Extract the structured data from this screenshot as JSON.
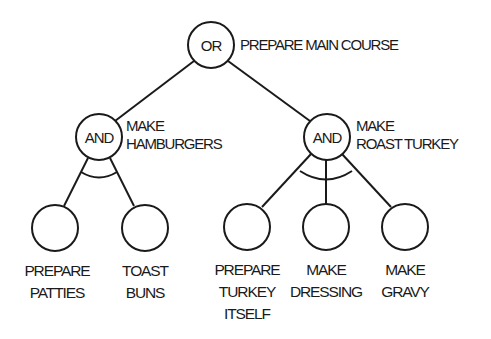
{
  "diagram": {
    "type": "and-or-tree",
    "root": {
      "gate": "OR",
      "label": "PREPARE MAIN COURSE",
      "children": [
        {
          "gate": "AND",
          "label_lines": [
            "MAKE",
            "HAMBURGERS"
          ],
          "children": [
            {
              "label_lines": [
                "PREPARE",
                "PATTIES"
              ]
            },
            {
              "label_lines": [
                "TOAST",
                "BUNS"
              ]
            }
          ]
        },
        {
          "gate": "AND",
          "label_lines": [
            "MAKE",
            "ROAST TURKEY"
          ],
          "children": [
            {
              "label_lines": [
                "PREPARE",
                "TURKEY",
                "ITSELF"
              ]
            },
            {
              "label_lines": [
                "MAKE",
                "DRESSING"
              ]
            },
            {
              "label_lines": [
                "MAKE",
                "GRAVY"
              ]
            }
          ]
        }
      ]
    },
    "colors": {
      "line": "#1a1a1a",
      "background": "#ffffff"
    }
  }
}
